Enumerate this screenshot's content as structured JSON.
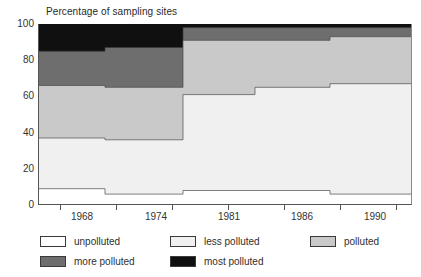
{
  "chart_data": {
    "type": "area",
    "title": "Percentage of sampling sites",
    "xlabel": "",
    "ylabel": "Percentage of sampling sites",
    "ylim": [
      0,
      100
    ],
    "yticks": [
      0,
      20,
      40,
      60,
      80,
      100
    ],
    "xticks": [
      1968,
      1974,
      1981,
      1986,
      1990
    ],
    "xtick_labels": [
      "1968",
      "1974",
      "1981",
      "1986",
      "1990"
    ],
    "grid": false,
    "legend_position": "below",
    "stacked": true,
    "step": true,
    "x_segments": [
      "1965-1970",
      "1971-1977",
      "1978-1983",
      "1984-1988",
      "1989-1992"
    ],
    "series": [
      {
        "name": "unpolluted",
        "color": "#ffffff",
        "values": [
          9,
          6,
          8,
          8,
          6
        ]
      },
      {
        "name": "less polluted",
        "color": "#f0f0f0",
        "values": [
          28,
          30,
          53,
          57,
          61
        ]
      },
      {
        "name": "polluted",
        "color": "#c9c9c9",
        "values": [
          29,
          29,
          30,
          26,
          26
        ]
      },
      {
        "name": "more polluted",
        "color": "#6e6e6e",
        "values": [
          19,
          22,
          7,
          7,
          5
        ]
      },
      {
        "name": "most polluted",
        "color": "#101010",
        "values": [
          15,
          13,
          2,
          2,
          2
        ]
      }
    ],
    "cumulative_tops": {
      "unpolluted": [
        9,
        6,
        8,
        8,
        6
      ],
      "less_polluted": [
        37,
        36,
        61,
        65,
        67
      ],
      "polluted": [
        66,
        65,
        91,
        91,
        93
      ],
      "more_polluted": [
        85,
        87,
        98,
        98,
        98
      ],
      "most_polluted": [
        100,
        100,
        100,
        100,
        100
      ]
    }
  },
  "legend": {
    "entries": [
      {
        "label": "unpolluted",
        "swatch": "#ffffff"
      },
      {
        "label": "less polluted",
        "swatch": "#f0f0f0"
      },
      {
        "label": "polluted",
        "swatch": "#c9c9c9"
      },
      {
        "label": "more polluted",
        "swatch": "#6e6e6e"
      },
      {
        "label": "most polluted",
        "swatch": "#101010"
      }
    ]
  },
  "axis": {
    "y_labels": [
      "100",
      "80",
      "60",
      "40",
      "20",
      "0"
    ],
    "x_labels": [
      "1968",
      "1974",
      "1981",
      "1986",
      "1990"
    ]
  }
}
